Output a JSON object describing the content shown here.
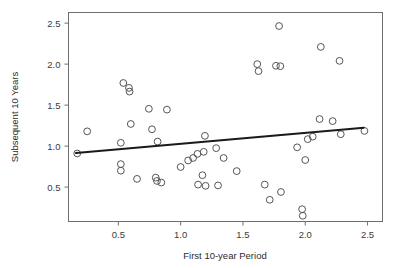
{
  "chart_data": {
    "type": "scatter",
    "title": "",
    "xlabel": "First 10-year Period",
    "ylabel": "Subsequent 10 Years",
    "xlim": [
      0.1,
      2.62
    ],
    "ylim": [
      0.08,
      2.63
    ],
    "xticks": [
      0.5,
      1.0,
      1.5,
      2.0,
      2.5
    ],
    "xticklabels": [
      "0.5",
      "1.0",
      "1.5",
      "2.0",
      "2.5"
    ],
    "yticks": [
      0.5,
      1.0,
      1.5,
      2.0,
      2.5
    ],
    "yticklabels": [
      "0.5",
      "1.0",
      "1.5",
      "2.0",
      "2.5"
    ],
    "grid": false,
    "legend": null,
    "marker": "open-circle",
    "marker_color": "#555555",
    "marker_radius": 3.4,
    "points": [
      {
        "x": 0.17,
        "y": 0.91
      },
      {
        "x": 0.25,
        "y": 1.18
      },
      {
        "x": 0.52,
        "y": 1.04
      },
      {
        "x": 0.52,
        "y": 0.78
      },
      {
        "x": 0.52,
        "y": 0.7
      },
      {
        "x": 0.54,
        "y": 1.77
      },
      {
        "x": 0.585,
        "y": 1.71
      },
      {
        "x": 0.59,
        "y": 1.665
      },
      {
        "x": 0.6,
        "y": 1.27
      },
      {
        "x": 0.65,
        "y": 0.6
      },
      {
        "x": 0.745,
        "y": 1.455
      },
      {
        "x": 0.77,
        "y": 1.205
      },
      {
        "x": 0.8,
        "y": 0.615
      },
      {
        "x": 0.81,
        "y": 0.575
      },
      {
        "x": 0.815,
        "y": 1.055
      },
      {
        "x": 0.845,
        "y": 0.555
      },
      {
        "x": 0.89,
        "y": 1.445
      },
      {
        "x": 1.0,
        "y": 0.745
      },
      {
        "x": 1.06,
        "y": 0.825
      },
      {
        "x": 1.1,
        "y": 0.855
      },
      {
        "x": 1.135,
        "y": 0.905
      },
      {
        "x": 1.14,
        "y": 0.53
      },
      {
        "x": 1.175,
        "y": 0.645
      },
      {
        "x": 1.185,
        "y": 0.93
      },
      {
        "x": 1.195,
        "y": 1.125
      },
      {
        "x": 1.2,
        "y": 0.515
      },
      {
        "x": 1.285,
        "y": 0.975
      },
      {
        "x": 1.3,
        "y": 0.52
      },
      {
        "x": 1.345,
        "y": 0.855
      },
      {
        "x": 1.45,
        "y": 0.695
      },
      {
        "x": 1.615,
        "y": 2.0
      },
      {
        "x": 1.625,
        "y": 1.915
      },
      {
        "x": 1.675,
        "y": 0.53
      },
      {
        "x": 1.715,
        "y": 0.345
      },
      {
        "x": 1.765,
        "y": 1.98
      },
      {
        "x": 1.79,
        "y": 2.465
      },
      {
        "x": 1.8,
        "y": 1.975
      },
      {
        "x": 1.805,
        "y": 0.44
      },
      {
        "x": 1.935,
        "y": 0.985
      },
      {
        "x": 1.975,
        "y": 0.23
      },
      {
        "x": 1.98,
        "y": 0.15
      },
      {
        "x": 2.0,
        "y": 0.83
      },
      {
        "x": 2.02,
        "y": 1.085
      },
      {
        "x": 2.06,
        "y": 1.115
      },
      {
        "x": 2.115,
        "y": 1.33
      },
      {
        "x": 2.125,
        "y": 2.21
      },
      {
        "x": 2.22,
        "y": 1.305
      },
      {
        "x": 2.275,
        "y": 2.04
      },
      {
        "x": 2.285,
        "y": 1.145
      },
      {
        "x": 2.475,
        "y": 1.185
      }
    ],
    "trend_line": {
      "type": "linear-fit",
      "color": "#1a1a1a",
      "width": 2.0,
      "x_start": 0.16,
      "y_start": 0.915,
      "x_end": 2.47,
      "y_end": 1.225
    },
    "frame": {
      "color": "#6e6e6e",
      "width": 1
    }
  }
}
